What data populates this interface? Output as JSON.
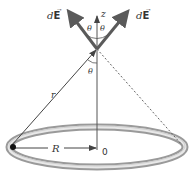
{
  "diagram": {
    "labels": {
      "dE_left": "dE",
      "dE_right": "dE",
      "z_axis": "z",
      "theta_upper_left": "θ",
      "theta_upper_right": "θ",
      "theta_lower": "θ",
      "r": "r",
      "R": "R",
      "origin": "0"
    },
    "colors": {
      "vector": "#5a5a5a",
      "axis": "#555555",
      "ring_outer": "#9a9a9a",
      "ring_inner": "#e6e6e6",
      "text": "#333333",
      "charge": "#111111"
    }
  }
}
